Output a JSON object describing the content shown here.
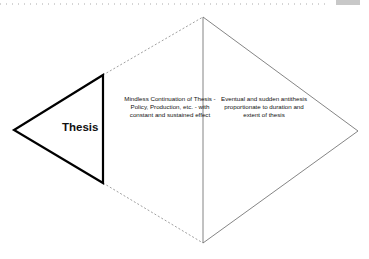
{
  "diagram": {
    "thesis_label": "Thesis",
    "middle_text": "Mindless Continuation of Thesis - Policy, Production, etc. - with constant and sustained effect",
    "right_text": "Eventual and sudden antithesis proportionate to duration and extent of thesis"
  },
  "colors": {
    "thesis_stroke": "#000000",
    "diamond_stroke": "#555555",
    "dotted_stroke": "#888888"
  }
}
